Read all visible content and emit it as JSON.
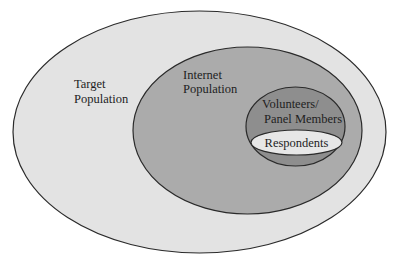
{
  "diagram": {
    "type": "nested-venn",
    "background": "#ffffff",
    "stroke": "#2a2a2a",
    "sets": [
      {
        "id": "target-population",
        "label_lines": [
          "Target",
          "Population"
        ],
        "fill": "#e3e3e3"
      },
      {
        "id": "internet-population",
        "label_lines": [
          "Internet",
          "Population"
        ],
        "fill": "#ababab"
      },
      {
        "id": "volunteers-panel-members",
        "label_lines": [
          "Volunteers/",
          "Panel Members"
        ],
        "fill": "#8e8e8e"
      },
      {
        "id": "respondents",
        "label_lines": [
          "Respondents"
        ],
        "fill": "#e7e7e7"
      }
    ],
    "nesting": "Respondents ⊂ Volunteers/Panel Members ⊂ Internet Population ⊂ Target Population"
  }
}
